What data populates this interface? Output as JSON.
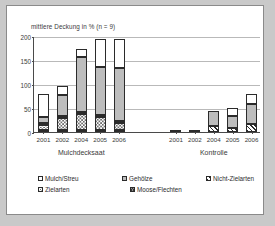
{
  "chart_data": {
    "type": "bar",
    "title": "mittlere Deckung in % (n = 9)",
    "subtitle": "",
    "xlabel": "",
    "ylabel": "",
    "ylim": [
      0,
      200
    ],
    "yticks": [
      0,
      50,
      100,
      150,
      200
    ],
    "grid": true,
    "stacked": true,
    "legend_position": "bottom",
    "groups": [
      {
        "name": "Mulchdecksaat",
        "categories": [
          "2001",
          "2002",
          "2004",
          "2005",
          "2006"
        ]
      },
      {
        "name": "Kontrolle",
        "categories": [
          "2001",
          "2002",
          "2004",
          "2005",
          "2006"
        ]
      }
    ],
    "categories": [
      "2001",
      "2002",
      "2004",
      "2005",
      "2006",
      "2001",
      "2002",
      "2004",
      "2005",
      "2006"
    ],
    "series": [
      {
        "name": "Moose/Flechten",
        "pattern": "crosshatch",
        "color": "#8f8f8f",
        "values": [
          3,
          2,
          2,
          2,
          2,
          0,
          0,
          0,
          0,
          0
        ]
      },
      {
        "name": "Zielarten",
        "pattern": "dotted",
        "color": "#ffffff",
        "values": [
          10,
          25,
          33,
          27,
          14,
          0,
          0,
          0,
          0,
          0
        ]
      },
      {
        "name": "Nicht-Zielarten",
        "pattern": "diagonal-hatch",
        "color": "#ffffff",
        "values": [
          4,
          2,
          1,
          1,
          1,
          0,
          0,
          12,
          9,
          17
        ]
      },
      {
        "name": "Gehölze",
        "pattern": "solid-gray",
        "color": "#bdbdbd",
        "values": [
          12,
          44,
          116,
          101,
          112,
          1,
          4,
          31,
          24,
          41
        ]
      },
      {
        "name": "Mulch/Streu",
        "pattern": "solid-white",
        "color": "#ffffff",
        "values": [
          49,
          19,
          16,
          58,
          60,
          0,
          0,
          0,
          18,
          21
        ]
      }
    ],
    "totals": [
      78,
      92,
      168,
      189,
      189,
      1,
      4,
      43,
      51,
      79
    ]
  },
  "legend": {
    "row1": [
      {
        "label": "Mulch/Streu",
        "pattern": "solid-white"
      },
      {
        "label": "Gehölze",
        "pattern": "solid-gray"
      },
      {
        "label": "Nicht-Zielarten",
        "pattern": "diagonal-hatch"
      }
    ],
    "row2": [
      {
        "label": "Zielarten",
        "pattern": "dotted"
      },
      {
        "label": "Moose/Flechten",
        "pattern": "crosshatch"
      }
    ]
  },
  "colors": {
    "background": "#ffffff",
    "page": "#c9c9c9",
    "axis": "#4a4a4a",
    "grid": "#b9b9b9",
    "text": "#3a3a3a",
    "gray_fill": "#bdbdbd",
    "dark": "#2b2b2b"
  }
}
